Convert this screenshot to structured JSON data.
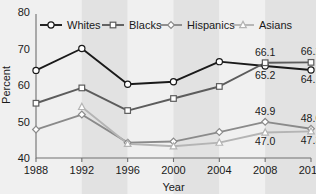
{
  "chart_data": {
    "type": "line",
    "title": "",
    "xlabel": "Year",
    "ylabel": "Percent",
    "x": [
      1988,
      1992,
      1996,
      2000,
      2004,
      2008,
      2012
    ],
    "xtick_labels": [
      "1988",
      "1992",
      "1996",
      "2000",
      "2004",
      "2008",
      "2012"
    ],
    "ytick_labels": [
      "40",
      "50",
      "60",
      "70",
      "80"
    ],
    "yticks": [
      40,
      50,
      60,
      70,
      80
    ],
    "ylim": [
      40,
      80
    ],
    "xlim": [
      1988,
      2012
    ],
    "grid": false,
    "legend_position": "top",
    "series": [
      {
        "name": "Whites",
        "marker": "circle",
        "color": "#1a1a1a",
        "values": [
          64.0,
          70.0,
          60.2,
          60.9,
          66.4,
          65.2,
          64.1
        ]
      },
      {
        "name": "Blacks",
        "marker": "square",
        "color": "#5c5c5c",
        "values": [
          55.0,
          59.2,
          53.0,
          56.3,
          59.6,
          66.1,
          66.2
        ]
      },
      {
        "name": "Hispanics",
        "marker": "diamond",
        "color": "#8a8a8a",
        "values": [
          47.8,
          51.9,
          44.2,
          44.5,
          47.1,
          49.9,
          48.0
        ]
      },
      {
        "name": "Asians",
        "marker": "triangle",
        "color": "#b4b4b4",
        "values": [
          null,
          54.0,
          43.9,
          43.2,
          44.2,
          47.0,
          47.3
        ]
      }
    ],
    "annotations": [
      {
        "text": "66.1",
        "series": "Blacks",
        "x": 2008,
        "value": 66.1,
        "position": "above"
      },
      {
        "text": "66.2",
        "series": "Blacks",
        "x": 2012,
        "value": 66.2,
        "position": "above"
      },
      {
        "text": "65.2",
        "series": "Whites",
        "x": 2008,
        "value": 65.2,
        "position": "below"
      },
      {
        "text": "64.1",
        "series": "Whites",
        "x": 2012,
        "value": 64.1,
        "position": "below"
      },
      {
        "text": "49.9",
        "series": "Hispanics",
        "x": 2008,
        "value": 49.9,
        "position": "above"
      },
      {
        "text": "48.0",
        "series": "Hispanics",
        "x": 2012,
        "value": 48.0,
        "position": "above"
      },
      {
        "text": "47.0",
        "series": "Asians",
        "x": 2008,
        "value": 47.0,
        "position": "below"
      },
      {
        "text": "47.3",
        "series": "Asians",
        "x": 2012,
        "value": 47.3,
        "position": "below"
      }
    ],
    "background": {
      "page_color": "#f3f3f3",
      "band_color_light": "#f0f0f0",
      "band_color_dark": "#e2e2e2"
    }
  },
  "axis": {
    "y_title": "Percent",
    "x_title": "Year"
  },
  "legend": {
    "items": [
      {
        "label": "Whites",
        "marker": "circle",
        "color": "#1a1a1a"
      },
      {
        "label": "Blacks",
        "marker": "square",
        "color": "#5c5c5c"
      },
      {
        "label": "Hispanics",
        "marker": "diamond",
        "color": "#8a8a8a"
      },
      {
        "label": "Asians",
        "marker": "triangle",
        "color": "#b4b4b4"
      }
    ]
  }
}
